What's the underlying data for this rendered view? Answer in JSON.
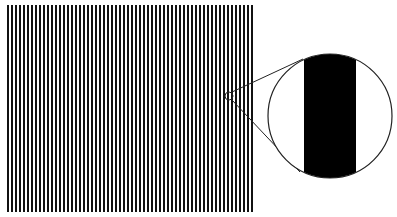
{
  "figure": {
    "colors": {
      "background": "#ffffff",
      "stripe": "#111111",
      "outline": "#222222"
    },
    "grating": {
      "x0": 7,
      "y0": 5,
      "x1": 256,
      "y1": 212,
      "period": 4,
      "bar_width": 2
    },
    "focus_circle": {
      "cx": 229,
      "cy": 96,
      "r": 4
    },
    "magnifier": {
      "cx": 330,
      "cy": 116,
      "r": 62,
      "band_x0": 304,
      "band_x1": 356
    },
    "leader_lines": [
      {
        "x1": 232,
        "y1": 92,
        "x2": 303,
        "y2": 59
      },
      {
        "x1": 232,
        "y1": 100,
        "x2": 300,
        "y2": 172
      }
    ]
  }
}
